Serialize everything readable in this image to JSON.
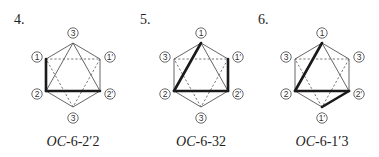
{
  "figure": {
    "diagrams": [
      {
        "number": "4.",
        "caption_prefix": "OC",
        "caption_suffix": "-6-2′2",
        "labels": {
          "top": "3",
          "upper_left": "1",
          "upper_right": "1′",
          "lower_left": "2",
          "lower_right": "2′",
          "bottom": "3"
        },
        "bold_edges": [
          [
            "upper_left",
            "lower_left"
          ],
          [
            "lower_left",
            "lower_right"
          ]
        ]
      },
      {
        "number": "5.",
        "caption_prefix": "OC",
        "caption_suffix": "-6-32",
        "labels": {
          "top": "1",
          "upper_left": "3",
          "upper_right": "1′",
          "lower_left": "2",
          "lower_right": "2′",
          "bottom": "3"
        },
        "bold_edges": [
          [
            "top",
            "lower_left"
          ],
          [
            "lower_left",
            "lower_right"
          ],
          [
            "upper_right",
            "lower_right"
          ]
        ]
      },
      {
        "number": "6.",
        "caption_prefix": "OC",
        "caption_suffix": "-6-1′3",
        "labels": {
          "top": "1",
          "upper_left": "3",
          "upper_right": "3",
          "lower_left": "2",
          "lower_right": "2′",
          "bottom": "1′"
        },
        "bold_edges": [
          [
            "top",
            "lower_left"
          ],
          [
            "lower_left",
            "lower_right"
          ],
          [
            "lower_right",
            "bottom"
          ]
        ]
      }
    ],
    "edges": {
      "solid": [
        [
          "top",
          "upper_left"
        ],
        [
          "upper_left",
          "lower_left"
        ],
        [
          "lower_left",
          "bottom"
        ],
        [
          "bottom",
          "lower_right"
        ],
        [
          "lower_right",
          "upper_right"
        ],
        [
          "upper_right",
          "top"
        ],
        [
          "top",
          "lower_left"
        ],
        [
          "lower_left",
          "lower_right"
        ],
        [
          "lower_right",
          "top"
        ]
      ],
      "dashed": [
        [
          "upper_left",
          "upper_right"
        ],
        [
          "upper_right",
          "bottom"
        ],
        [
          "bottom",
          "upper_left"
        ]
      ]
    }
  }
}
